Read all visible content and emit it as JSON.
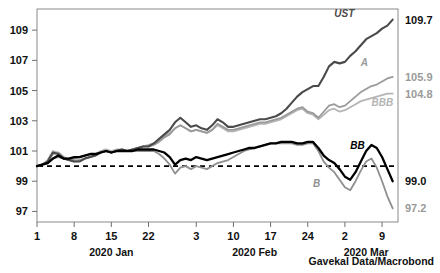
{
  "chart_data": {
    "type": "line",
    "title": "",
    "subtitle": "",
    "xlabel": "",
    "ylabel": "",
    "source": "Gavekal Data/Macrobond",
    "grid": false,
    "legend_position": "inline-right",
    "ylim": [
      96.3,
      110.4
    ],
    "yticks": [
      97,
      99,
      101,
      103,
      105,
      107,
      109
    ],
    "ytick_labels": [
      "97",
      "99",
      "101",
      "103",
      "105",
      "107",
      "109"
    ],
    "xlim": [
      0,
      68
    ],
    "xticks": [
      0,
      7,
      14,
      21,
      30,
      37,
      44,
      51,
      58,
      65
    ],
    "xtick_labels": [
      "1",
      "8",
      "15",
      "22",
      "3",
      "10",
      "17",
      "24",
      "2",
      "9"
    ],
    "month_groups": [
      {
        "label": "2020 Jan",
        "x": 14
      },
      {
        "label": "2020 Feb",
        "x": 41
      },
      {
        "label": "2020 Mar",
        "x": 62
      }
    ],
    "reference_line": {
      "value": 100,
      "style": "dashed",
      "color": "#000000"
    },
    "series": [
      {
        "name": "UST",
        "label": "UST",
        "color": "#4a4a4a",
        "width": 2.1,
        "end_value": 109.7,
        "end_label": "109.7",
        "end_label_color": "#111111",
        "label_x": 56,
        "label_y": 109.9,
        "x": [
          0,
          1,
          2,
          3,
          4,
          5,
          6,
          7,
          8,
          9,
          10,
          11,
          12,
          13,
          14,
          15,
          16,
          17,
          18,
          19,
          20,
          21,
          22,
          23,
          24,
          25,
          26,
          27,
          28,
          29,
          30,
          31,
          32,
          33,
          34,
          35,
          36,
          37,
          38,
          39,
          40,
          41,
          42,
          43,
          44,
          45,
          46,
          47,
          48,
          49,
          50,
          51,
          52,
          53,
          54,
          55,
          56,
          57,
          58,
          59,
          60,
          61,
          62,
          63,
          64,
          65,
          66,
          67
        ],
        "values": [
          100.0,
          100.1,
          100.3,
          100.9,
          100.8,
          100.5,
          100.4,
          100.3,
          100.3,
          100.5,
          100.6,
          100.7,
          100.9,
          101.0,
          100.9,
          101.0,
          101.1,
          101.0,
          101.1,
          101.2,
          101.3,
          101.3,
          101.5,
          101.8,
          102.1,
          102.4,
          102.9,
          103.2,
          102.9,
          102.6,
          102.7,
          102.5,
          102.4,
          102.7,
          103.1,
          102.9,
          102.6,
          102.6,
          102.7,
          102.8,
          102.9,
          103.0,
          103.1,
          103.1,
          103.2,
          103.3,
          103.5,
          103.8,
          104.2,
          104.6,
          104.9,
          105.1,
          105.3,
          105.3,
          105.9,
          106.6,
          106.9,
          106.8,
          106.9,
          107.3,
          107.6,
          108.0,
          108.4,
          108.6,
          108.8,
          109.1,
          109.3,
          109.7
        ]
      },
      {
        "name": "A",
        "label": "A",
        "color": "#9a9a9a",
        "width": 1.8,
        "end_value": 105.9,
        "end_label": "105.9",
        "end_label_color": "#9a9a9a",
        "label_x": 61,
        "label_y": 106.6,
        "x": [
          0,
          1,
          2,
          3,
          4,
          5,
          6,
          7,
          8,
          9,
          10,
          11,
          12,
          13,
          14,
          15,
          16,
          17,
          18,
          19,
          20,
          21,
          22,
          23,
          24,
          25,
          26,
          27,
          28,
          29,
          30,
          31,
          32,
          33,
          34,
          35,
          36,
          37,
          38,
          39,
          40,
          41,
          42,
          43,
          44,
          45,
          46,
          47,
          48,
          49,
          50,
          51,
          52,
          53,
          54,
          55,
          56,
          57,
          58,
          59,
          60,
          61,
          62,
          63,
          64,
          65,
          66,
          67
        ],
        "values": [
          100.0,
          100.1,
          100.3,
          100.8,
          100.9,
          100.6,
          100.4,
          100.3,
          100.4,
          100.5,
          100.6,
          100.7,
          100.9,
          101.0,
          100.9,
          101.0,
          101.1,
          101.0,
          101.1,
          101.2,
          101.3,
          101.3,
          101.4,
          101.6,
          101.9,
          102.1,
          102.5,
          102.7,
          102.5,
          102.3,
          102.4,
          102.3,
          102.2,
          102.4,
          102.8,
          102.6,
          102.4,
          102.4,
          102.5,
          102.6,
          102.7,
          102.8,
          102.9,
          102.9,
          103.0,
          103.1,
          103.2,
          103.4,
          103.6,
          103.8,
          103.9,
          103.6,
          103.5,
          103.2,
          103.6,
          104.0,
          104.1,
          103.9,
          104.0,
          104.3,
          104.6,
          104.9,
          105.1,
          105.3,
          105.4,
          105.6,
          105.8,
          105.9
        ]
      },
      {
        "name": "BBB",
        "label": "BBB",
        "color": "#b5b5b5",
        "width": 1.8,
        "end_value": 104.8,
        "end_label": "104.8",
        "end_label_color": "#9a9a9a",
        "label_x": 63,
        "label_y": 104.0,
        "x": [
          0,
          1,
          2,
          3,
          4,
          5,
          6,
          7,
          8,
          9,
          10,
          11,
          12,
          13,
          14,
          15,
          16,
          17,
          18,
          19,
          20,
          21,
          22,
          23,
          24,
          25,
          26,
          27,
          28,
          29,
          30,
          31,
          32,
          33,
          34,
          35,
          36,
          37,
          38,
          39,
          40,
          41,
          42,
          43,
          44,
          45,
          46,
          47,
          48,
          49,
          50,
          51,
          52,
          53,
          54,
          55,
          56,
          57,
          58,
          59,
          60,
          61,
          62,
          63,
          64,
          65,
          66,
          67
        ],
        "values": [
          100.0,
          100.1,
          100.4,
          101.0,
          100.9,
          100.6,
          100.5,
          100.4,
          100.4,
          100.5,
          100.6,
          100.8,
          101.0,
          101.1,
          101.0,
          101.1,
          101.1,
          101.0,
          101.1,
          101.2,
          101.3,
          101.4,
          101.5,
          101.7,
          102.0,
          102.2,
          102.5,
          102.7,
          102.5,
          102.3,
          102.4,
          102.3,
          102.2,
          102.4,
          102.7,
          102.5,
          102.3,
          102.3,
          102.4,
          102.5,
          102.6,
          102.7,
          102.8,
          102.8,
          102.9,
          103.0,
          103.1,
          103.3,
          103.5,
          103.7,
          103.8,
          103.5,
          103.4,
          103.1,
          103.4,
          103.7,
          103.8,
          103.6,
          103.7,
          103.9,
          104.1,
          104.3,
          104.4,
          104.5,
          104.6,
          104.7,
          104.8,
          104.8
        ]
      },
      {
        "name": "BB",
        "label": "BB",
        "color": "#000000",
        "width": 2.3,
        "end_value": 99.0,
        "end_label": "99.0",
        "end_label_color": "#111111",
        "label_x": 59,
        "label_y": 101.1,
        "x": [
          0,
          1,
          2,
          3,
          4,
          5,
          6,
          7,
          8,
          9,
          10,
          11,
          12,
          13,
          14,
          15,
          16,
          17,
          18,
          19,
          20,
          21,
          22,
          23,
          24,
          25,
          26,
          27,
          28,
          29,
          30,
          31,
          32,
          33,
          34,
          35,
          36,
          37,
          38,
          39,
          40,
          41,
          42,
          43,
          44,
          45,
          46,
          47,
          48,
          49,
          50,
          51,
          52,
          53,
          54,
          55,
          56,
          57,
          58,
          59,
          60,
          61,
          62,
          63,
          64,
          65,
          66,
          67
        ],
        "values": [
          100.0,
          100.1,
          100.2,
          100.5,
          100.7,
          100.5,
          100.5,
          100.6,
          100.6,
          100.7,
          100.8,
          100.8,
          100.9,
          101.0,
          100.9,
          101.0,
          101.0,
          101.0,
          101.0,
          101.1,
          101.1,
          101.1,
          101.1,
          101.0,
          100.9,
          100.6,
          100.1,
          100.4,
          100.5,
          100.4,
          100.6,
          100.5,
          100.4,
          100.5,
          100.6,
          100.7,
          100.8,
          100.9,
          101.0,
          101.1,
          101.2,
          101.2,
          101.3,
          101.4,
          101.5,
          101.5,
          101.6,
          101.6,
          101.6,
          101.5,
          101.5,
          101.6,
          101.6,
          101.2,
          100.7,
          100.4,
          100.2,
          99.8,
          99.3,
          99.1,
          99.6,
          100.3,
          101.0,
          101.4,
          101.2,
          100.6,
          99.8,
          99.0
        ]
      },
      {
        "name": "B",
        "label": "B",
        "color": "#8f8f8f",
        "width": 1.8,
        "end_value": 97.2,
        "end_label": "97.2",
        "end_label_color": "#9a9a9a",
        "label_x": 52,
        "label_y": 98.6,
        "x": [
          0,
          1,
          2,
          3,
          4,
          5,
          6,
          7,
          8,
          9,
          10,
          11,
          12,
          13,
          14,
          15,
          16,
          17,
          18,
          19,
          20,
          21,
          22,
          23,
          24,
          25,
          26,
          27,
          28,
          29,
          30,
          31,
          32,
          33,
          34,
          35,
          36,
          37,
          38,
          39,
          40,
          41,
          42,
          43,
          44,
          45,
          46,
          47,
          48,
          49,
          50,
          51,
          52,
          53,
          54,
          55,
          56,
          57,
          58,
          59,
          60,
          61,
          62,
          63,
          64,
          65,
          66,
          67
        ],
        "values": [
          100.0,
          100.1,
          100.2,
          100.5,
          100.6,
          100.5,
          100.4,
          100.5,
          100.6,
          100.7,
          100.8,
          100.8,
          100.9,
          101.0,
          100.9,
          101.0,
          101.0,
          101.0,
          101.0,
          101.0,
          101.0,
          101.0,
          101.0,
          100.8,
          100.5,
          100.1,
          99.5,
          99.9,
          100.0,
          99.8,
          100.0,
          99.9,
          99.8,
          100.0,
          100.2,
          100.3,
          100.4,
          100.6,
          100.8,
          101.0,
          101.1,
          101.2,
          101.3,
          101.4,
          101.5,
          101.5,
          101.5,
          101.5,
          101.5,
          101.4,
          101.4,
          101.5,
          101.5,
          101.0,
          100.3,
          99.9,
          99.6,
          99.1,
          98.6,
          98.4,
          99.0,
          99.7,
          100.3,
          100.5,
          99.9,
          99.0,
          98.0,
          97.2
        ]
      }
    ]
  }
}
